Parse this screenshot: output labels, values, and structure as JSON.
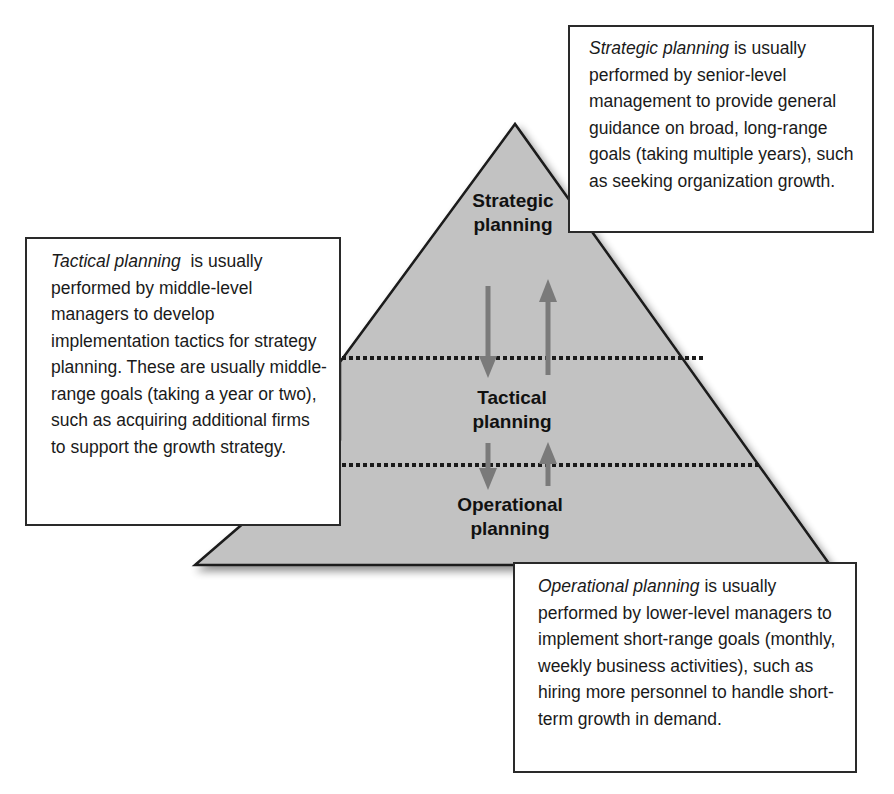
{
  "diagram": {
    "colors": {
      "pyramid_fill": "#c2c2c2",
      "pyramid_stroke": "#1a1a1a",
      "arrow": "#7a7a7a",
      "divider": "#1a1a1a",
      "box_border": "#2a2a2a"
    },
    "levels": [
      {
        "line1": "Strategic",
        "line2": "planning"
      },
      {
        "line1": "Tactical",
        "line2": "planning"
      },
      {
        "line1": "Operational",
        "line2": "planning"
      }
    ],
    "boxes": {
      "strategic": {
        "term": "Strategic planning",
        "text": " is usually performed by senior-level management to provide general guidance on broad, long-range goals (taking multiple years), such as seeking organization growth."
      },
      "tactical": {
        "term": "Tactical planning",
        "text": "  is usually performed by middle-level managers to develop implementation tactics for strategy planning. These are usually middle-range goals (taking a year or two), such as acquiring additional firms to support the growth strategy."
      },
      "operational": {
        "term": "Operational planning",
        "text": " is usually performed by lower-level managers to implement short-range goals (monthly, weekly business activities), such as hiring more personnel to handle short-term growth in demand."
      }
    }
  }
}
